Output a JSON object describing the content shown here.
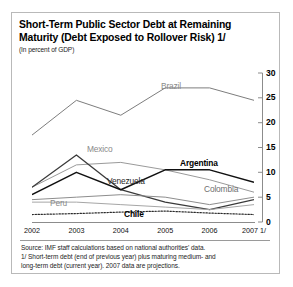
{
  "figure": {
    "title": "Short-Term Public Sector Debt at Remaining Maturity (Debt Exposed to Rollover Risk) 1/",
    "title_line1": "Short-Term Public Sector Debt at Remaining",
    "title_line2": "Maturity (Debt Exposed to Rollover Risk) 1/",
    "subtitle": "(In percent of GDP)",
    "source_line": "Source: IMF staff calculations based on national authorities' data.",
    "footnote_line1": "1/ Short-term debt (end of previous year) plus maturing medium- and",
    "footnote_line2": "long-term debt (current year). 2007 data are projections."
  },
  "chart_data": {
    "type": "line",
    "title": "Short-Term Public Sector Debt at Remaining Maturity (Debt Exposed to Rollover Risk) 1/",
    "subtitle": "(In percent of GDP)",
    "xlabel": "",
    "ylabel": "In percent of GDP",
    "x": [
      "2002",
      "2003",
      "2004",
      "2005",
      "2006",
      "2007 1/"
    ],
    "categories": [
      "2002",
      "2003",
      "2004",
      "2005",
      "2006",
      "2007 1/"
    ],
    "ylim": [
      0,
      30
    ],
    "yticks": [
      0,
      5,
      10,
      15,
      20,
      25,
      30
    ],
    "ytick_labels": [
      "0",
      "5",
      "10",
      "15",
      "20",
      "25",
      "30"
    ],
    "y_axis_position": "right",
    "grid": false,
    "legend": "inline-labels",
    "series": [
      {
        "name": "Brazil",
        "values": [
          17.5,
          24.5,
          21.5,
          27.0,
          27.0,
          24.5
        ],
        "color": "#7d7d7d",
        "style": "solid",
        "label_color": "#8a8a8a"
      },
      {
        "name": "Mexico",
        "values": [
          7.0,
          11.5,
          12.0,
          10.5,
          8.5,
          6.0
        ],
        "color": "#9a9a9a",
        "style": "solid",
        "label_color": "#8a8a8a"
      },
      {
        "name": "Venezuela",
        "values": [
          7.0,
          13.5,
          6.5,
          4.0,
          2.5,
          4.5
        ],
        "color": "#3a3a3a",
        "style": "solid",
        "label_color": "#4a4a4a"
      },
      {
        "name": "Argentina",
        "values": [
          5.5,
          10.0,
          6.5,
          10.5,
          10.5,
          8.0
        ],
        "color": "#111111",
        "style": "solid",
        "label_color": "#000000"
      },
      {
        "name": "Colombia",
        "values": [
          4.5,
          5.0,
          5.5,
          5.0,
          3.5,
          5.0
        ],
        "color": "#8d8d8d",
        "style": "solid",
        "label_color": "#6f6f6f"
      },
      {
        "name": "Peru",
        "values": [
          4.0,
          4.0,
          3.5,
          3.0,
          2.5,
          3.5
        ],
        "color": "#a6a6a6",
        "style": "solid",
        "label_color": "#8a8a8a"
      },
      {
        "name": "Chile",
        "values": [
          1.5,
          1.7,
          2.0,
          2.2,
          1.8,
          1.5
        ],
        "color": "#2a2a2a",
        "style": "dotted",
        "label_color": "#000000"
      }
    ]
  },
  "axis": {
    "y_labels": [
      "30",
      "25",
      "20",
      "15",
      "10",
      "5",
      "0"
    ],
    "x_labels": [
      "2002",
      "2003",
      "2004",
      "2005",
      "2006",
      "2007 1/"
    ]
  },
  "labels": {
    "brazil": "Brazil",
    "mexico": "Mexico",
    "venezuela": "Venezuela",
    "argentina": "Argentina",
    "colombia": "Colombia",
    "peru": "Peru",
    "chile": "Chile"
  }
}
